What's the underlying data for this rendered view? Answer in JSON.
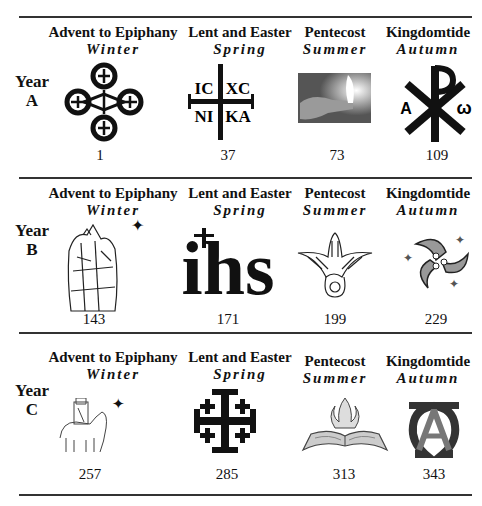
{
  "seasons": [
    {
      "name": "Advent to Epiphany",
      "sub": "Winter"
    },
    {
      "name": "Lent and Easter",
      "sub": "Spring"
    },
    {
      "name": "Pentecost",
      "sub": "Summer"
    },
    {
      "name": "Kingdomtide",
      "sub": "Autumn"
    }
  ],
  "years": [
    {
      "label_top": "Year",
      "label_bottom": "A",
      "items": [
        {
          "icon": "quatrefoil-crosses-icon",
          "number": "1"
        },
        {
          "icon": "ic-xc-nika-cross-icon",
          "number": "37"
        },
        {
          "icon": "candle-flame-photo-icon",
          "number": "73"
        },
        {
          "icon": "chi-rho-alpha-omega-icon",
          "number": "109"
        }
      ]
    },
    {
      "label_top": "Year",
      "label_bottom": "B",
      "items": [
        {
          "icon": "magi-kings-icon",
          "number": "143"
        },
        {
          "icon": "ihs-monogram-icon",
          "number": "171"
        },
        {
          "icon": "descending-dove-icon",
          "number": "199"
        },
        {
          "icon": "triskele-fish-stars-icon",
          "number": "229"
        }
      ]
    },
    {
      "label_top": "Year",
      "label_bottom": "C",
      "items": [
        {
          "icon": "magi-on-camel-icon",
          "number": "257"
        },
        {
          "icon": "jerusalem-cross-icon",
          "number": "285"
        },
        {
          "icon": "open-bible-flame-icon",
          "number": "313"
        },
        {
          "icon": "alpha-omega-monogram-icon",
          "number": "343"
        }
      ]
    }
  ],
  "glyphs": {
    "ic": "IC",
    "xc": "XC",
    "ni": "NI",
    "ka": "KA",
    "alpha": "A",
    "omega": "ω",
    "ihs": "ihs",
    "star": "✦"
  }
}
